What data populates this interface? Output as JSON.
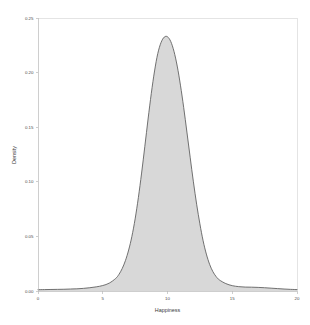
{
  "chart_data": {
    "type": "area",
    "title": "",
    "subtitle": "",
    "xlabel": "Happiness",
    "ylabel": "Density",
    "xlim": [
      0,
      20
    ],
    "ylim": [
      0,
      0.25
    ],
    "grid": false,
    "legend": null,
    "legend_position": "none",
    "xticks": [
      0,
      5,
      10,
      15,
      20
    ],
    "xticklabels": [
      "0",
      "5",
      "10",
      "15",
      "20"
    ],
    "yticks": [
      0.0,
      0.05,
      0.1,
      0.15,
      0.2,
      0.25
    ],
    "yticklabels": [
      "0.00",
      "0.05",
      "0.10",
      "0.15",
      "0.20",
      "0.25"
    ],
    "series": [
      {
        "name": "Density",
        "fill_color": "#d8d8d8",
        "line_color": "#5a5a5a",
        "x": [
          0.0,
          0.5,
          1.0,
          1.5,
          2.0,
          2.5,
          3.0,
          3.5,
          4.0,
          4.5,
          5.0,
          5.5,
          6.0,
          6.25,
          6.5,
          6.75,
          7.0,
          7.25,
          7.5,
          7.75,
          8.0,
          8.25,
          8.5,
          8.75,
          9.0,
          9.25,
          9.5,
          9.75,
          10.0,
          10.25,
          10.5,
          10.75,
          11.0,
          11.25,
          11.5,
          11.75,
          12.0,
          12.25,
          12.5,
          12.75,
          13.0,
          13.25,
          13.5,
          13.75,
          14.0,
          14.5,
          15.0,
          15.5,
          16.0,
          16.5,
          17.0,
          17.5,
          18.0,
          18.5,
          19.0,
          19.5,
          20.0
        ],
        "y": [
          0.0012,
          0.0013,
          0.0014,
          0.0015,
          0.0016,
          0.0018,
          0.002,
          0.0024,
          0.003,
          0.0038,
          0.005,
          0.0072,
          0.0115,
          0.0152,
          0.0205,
          0.0278,
          0.0375,
          0.05,
          0.066,
          0.0855,
          0.108,
          0.1325,
          0.1575,
          0.181,
          0.2015,
          0.2175,
          0.2275,
          0.2325,
          0.2328,
          0.2285,
          0.2195,
          0.206,
          0.1885,
          0.168,
          0.1455,
          0.1225,
          0.1,
          0.0795,
          0.0615,
          0.046,
          0.0338,
          0.0245,
          0.0178,
          0.0133,
          0.0102,
          0.0068,
          0.0049,
          0.004,
          0.0036,
          0.0035,
          0.0033,
          0.003,
          0.0026,
          0.0022,
          0.0018,
          0.0015,
          0.0013
        ]
      }
    ],
    "peak": {
      "x": 9.85,
      "y": 0.2328
    }
  },
  "axes": {
    "x_title": "Happiness",
    "y_title": "Density"
  },
  "colors": {
    "fill": "#d8d8d8",
    "stroke": "#5a5a5a",
    "axis": "#b9b9b9",
    "frame": "#d9d9d9",
    "text": "#4a4a4a",
    "background": "#ffffff"
  }
}
